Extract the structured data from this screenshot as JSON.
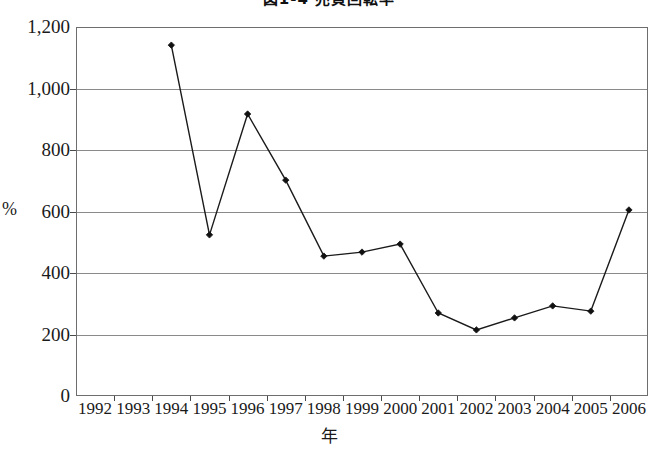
{
  "chart_data": {
    "type": "line",
    "title": "図1-4 売買回転率",
    "title_clipped": true,
    "xlabel": "年",
    "ylabel": "%",
    "categories": [
      "1992",
      "1993",
      "1994",
      "1995",
      "1996",
      "1997",
      "1998",
      "1999",
      "2000",
      "2001",
      "2002",
      "2003",
      "2004",
      "2005",
      "2006"
    ],
    "x": [
      1992,
      1993,
      1994,
      1995,
      1996,
      1997,
      1998,
      1999,
      2000,
      2001,
      2002,
      2003,
      2004,
      2005,
      2006
    ],
    "values": [
      null,
      null,
      1141,
      524,
      917,
      702,
      455,
      468,
      494,
      270,
      215,
      254,
      293,
      276,
      605
    ],
    "series": [
      {
        "name": "売買回転率",
        "points": [
          {
            "x": "1994",
            "y": 1141
          },
          {
            "x": "1995",
            "y": 524
          },
          {
            "x": "1996",
            "y": 917
          },
          {
            "x": "1997",
            "y": 702
          },
          {
            "x": "1998",
            "y": 455
          },
          {
            "x": "1999",
            "y": 468
          },
          {
            "x": "2000",
            "y": 494
          },
          {
            "x": "2001",
            "y": 270
          },
          {
            "x": "2002",
            "y": 215
          },
          {
            "x": "2003",
            "y": 254
          },
          {
            "x": "2004",
            "y": 293
          },
          {
            "x": "2005",
            "y": 276
          },
          {
            "x": "2006",
            "y": 605
          }
        ],
        "color": "#1a1a1a",
        "marker": "diamond"
      }
    ],
    "ylim": [
      0,
      1200
    ],
    "yticks": [
      0,
      200,
      400,
      600,
      800,
      1000,
      1200
    ],
    "ytick_labels": [
      "0",
      "200",
      "400",
      "600",
      "800",
      "1,000",
      "1,200"
    ],
    "grid": "horizontal",
    "legend": "none",
    "line_color": "#1a1a1a",
    "grid_color": "#8a8a8a",
    "frame_color": "#6e6e6e",
    "background": "#ffffff"
  }
}
